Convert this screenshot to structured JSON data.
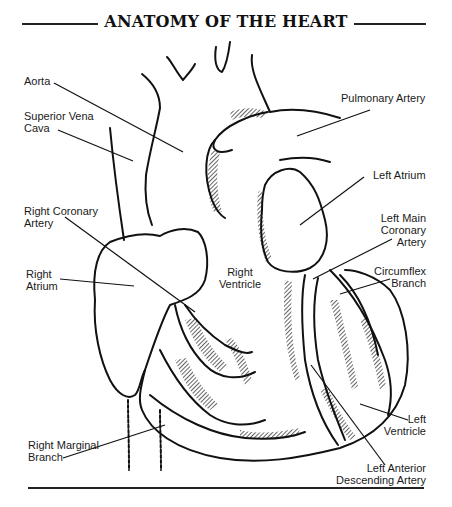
{
  "title": "ANATOMY OF THE HEART",
  "labels": {
    "aorta": "Aorta",
    "superior_vena_cava_1": "Superior Vena",
    "superior_vena_cava_2": "Cava",
    "pulmonary_artery": "Pulmonary Artery",
    "left_atrium": "Left Atrium",
    "right_coronary_artery_1": "Right Coronary",
    "right_coronary_artery_2": "Artery",
    "left_main_coronary_artery_1": "Left Main",
    "left_main_coronary_artery_2": "Coronary",
    "left_main_coronary_artery_3": "Artery",
    "right_atrium_1": "Right",
    "right_atrium_2": "Atrium",
    "right_ventricle_1": "Right",
    "right_ventricle_2": "Ventricle",
    "circumflex_branch_1": "Circumflex",
    "circumflex_branch_2": "Branch",
    "left_ventricle_1": "Left",
    "left_ventricle_2": "Ventricle",
    "right_marginal_branch_1": "Right Marginal",
    "right_marginal_branch_2": "Branch",
    "left_anterior_descending_artery_1": "Left Anterior",
    "left_anterior_descending_artery_2": "Descending Artery"
  },
  "colors": {
    "ink": "#111111",
    "background": "#ffffff"
  }
}
